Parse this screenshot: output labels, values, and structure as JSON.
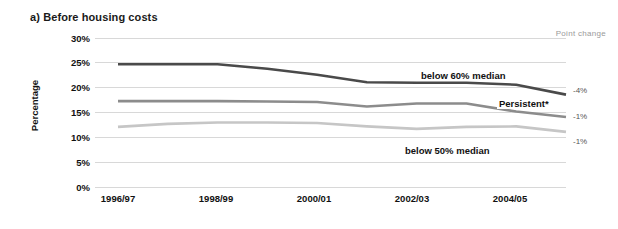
{
  "panel": {
    "title": "a) Before housing costs"
  },
  "axes": {
    "ylabel": "Percentage",
    "yticks": [
      "30%",
      "25%",
      "20%",
      "15%",
      "10%",
      "5%",
      "0%"
    ],
    "xticks": [
      "1996/97",
      "1998/99",
      "2000/01",
      "2002/03",
      "2004/05"
    ]
  },
  "point_change": {
    "header": "Point change",
    "values": [
      "-4%",
      "-1%",
      "-1%"
    ]
  },
  "series_labels": {
    "below60": "below 60% median",
    "persistent": "Persistent*",
    "below50": "below 50% median"
  },
  "colors": {
    "below60": "#4a4a4a",
    "persistent": "#8c8c8c",
    "below50": "#c6c6c6",
    "grid": "#d8d8d8",
    "text": "#111111",
    "muted": "#9a9a9a"
  },
  "chart_data": {
    "type": "line",
    "title": "a) Before housing costs",
    "xlabel": "",
    "ylabel": "Percentage",
    "ylim": [
      0,
      30
    ],
    "grid": true,
    "legend": "inline-annotations",
    "x": [
      "1996/97",
      "1997/98",
      "1998/99",
      "1999/00",
      "2000/01",
      "2001/02",
      "2002/03",
      "2003/04",
      "2004/05",
      "2005/06"
    ],
    "xtick_labels": [
      "1996/97",
      "1998/99",
      "2000/01",
      "2002/03",
      "2004/05"
    ],
    "series": [
      {
        "name": "below 60% median",
        "color": "#4a4a4a",
        "point_change": "-4%",
        "values": [
          24.7,
          24.7,
          24.7,
          23.8,
          22.6,
          21.1,
          21.0,
          21.0,
          20.6,
          18.6
        ]
      },
      {
        "name": "Persistent*",
        "color": "#8c8c8c",
        "point_change": "-1%",
        "values": [
          17.3,
          17.3,
          17.3,
          17.2,
          17.1,
          16.2,
          16.8,
          16.8,
          15.2,
          14.1
        ]
      },
      {
        "name": "below 50% median",
        "color": "#c6c6c6",
        "point_change": "-1%",
        "values": [
          12.1,
          12.7,
          13.0,
          13.0,
          12.9,
          12.2,
          11.7,
          12.1,
          12.2,
          11.1
        ]
      }
    ]
  }
}
